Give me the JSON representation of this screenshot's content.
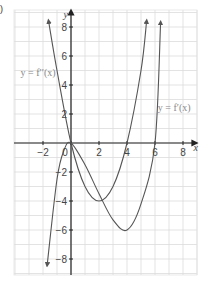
{
  "chart_data": {
    "type": "line",
    "title": "",
    "part_label": ")",
    "xlabel": "x",
    "ylabel": "y",
    "xlim": [
      -4,
      9
    ],
    "ylim": [
      -9,
      9
    ],
    "grid": true,
    "x_ticks": [
      -2,
      0,
      2,
      4,
      6,
      8
    ],
    "x_tick_labels": [
      "−2",
      "0",
      "2",
      "4",
      "6",
      "8"
    ],
    "y_ticks": [
      8,
      6,
      4,
      2,
      -2,
      -4,
      -6,
      -8
    ],
    "y_tick_labels": [
      "8",
      "6",
      "4",
      "2",
      "−2",
      "−4",
      "−6",
      "−8"
    ],
    "series": [
      {
        "name": "y = f′′(x)",
        "label_position": [
          -3.6,
          4.6
        ],
        "description": "parabola through (0,0), minimum (2,-4), through (4,0), arrows at both ends",
        "x": [
          -1.6,
          -1,
          0,
          1,
          2,
          3,
          4,
          5,
          5.4
        ],
        "y": [
          8.4,
          5,
          0,
          -3,
          -4,
          -3,
          0,
          5,
          8.4
        ]
      },
      {
        "name": "y = f′(x)",
        "label_position": [
          6.2,
          2.2
        ],
        "description": "cubic with local max at (0,0), local min at (4,-6), root at (6,0), arrows at both ends",
        "x": [
          -1.7,
          -1,
          -0.5,
          0,
          1,
          2,
          3,
          4,
          5,
          6,
          6.4
        ],
        "y": [
          -8.4,
          -2.5,
          -0.5,
          0,
          -1.5,
          -3.5,
          -5.3,
          -6,
          -4.2,
          0,
          8.3
        ]
      }
    ]
  }
}
